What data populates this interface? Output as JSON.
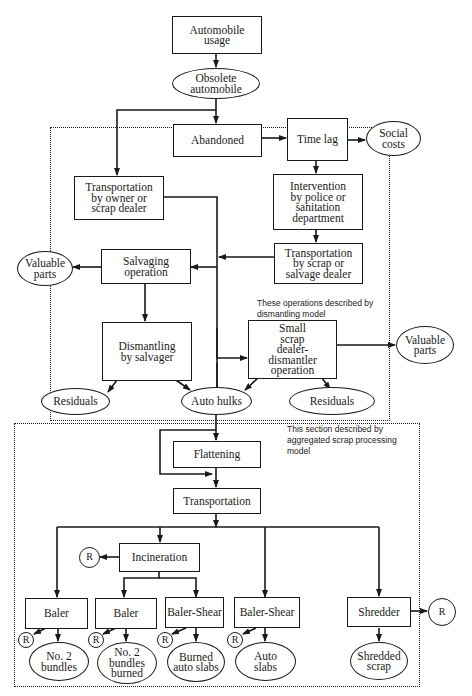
{
  "nodes": {
    "automobile_usage": "Automobile usage",
    "obsolete_automobile": "Obsolete automobile",
    "abandoned": "Abandoned",
    "time_lag": "Time lag",
    "social_costs": "Social costs",
    "transport_owner": "Transportation by owner or scrap dealer",
    "intervention": "Intervention by police or sanitation department",
    "transport_scrap": "Transportation by scrap or salvage dealer",
    "salvaging": "Salvaging operation",
    "valuable_parts_left": "Valuable parts",
    "dismantling": "Dismantling by salvager",
    "small_scrap": "Small scrap dealer-dismantler operation",
    "valuable_parts_right": "Valuable parts",
    "residuals_left": "Residuals",
    "auto_hulks": "Auto hulks",
    "residuals_right": "Residuals",
    "flattening": "Flattening",
    "transportation": "Transportation",
    "incineration": "Incineration",
    "baler_1": "Baler",
    "baler_2": "Baler",
    "baler_shear_1": "Baler-Shear",
    "baler_shear_2": "Baler-Shear",
    "shredder": "Shredder",
    "no2_bundles": "No. 2 bundles",
    "no2_bundles_burned": "No. 2 bundles burned",
    "burned_auto_slabs": "Burned auto slabs",
    "auto_slabs": "Auto slabs",
    "shredded_scrap": "Shredded scrap",
    "residue_marker": "R"
  },
  "regions": {
    "dismantling_model_note": "These operations described by dismantling model",
    "scrap_processing_note": "This section described by aggregated scrap processing model"
  }
}
